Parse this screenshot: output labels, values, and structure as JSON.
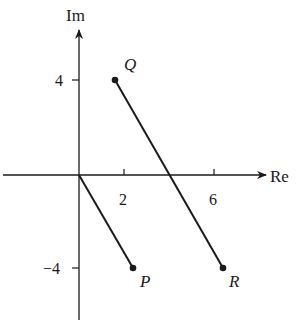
{
  "axes": {
    "x_label": "Re",
    "y_label": "Im",
    "x_ticks": [
      {
        "value": 2,
        "label": "2"
      },
      {
        "value": 6,
        "label": "6"
      }
    ],
    "y_ticks": [
      {
        "value": 4,
        "label": "4"
      },
      {
        "value": -4,
        "label": "−4"
      }
    ]
  },
  "points": [
    {
      "name": "Q",
      "label": "Q",
      "re": 1.6,
      "im": 4
    },
    {
      "name": "P",
      "label": "P",
      "re": 2.4,
      "im": -4
    },
    {
      "name": "R",
      "label": "R",
      "re": 6.4,
      "im": -4
    }
  ],
  "segments": [
    {
      "from": "O",
      "to": "P"
    },
    {
      "from": "Q",
      "to": "R"
    }
  ],
  "colors": {
    "ink": "#1a1a1a",
    "background": "#ffffff"
  }
}
